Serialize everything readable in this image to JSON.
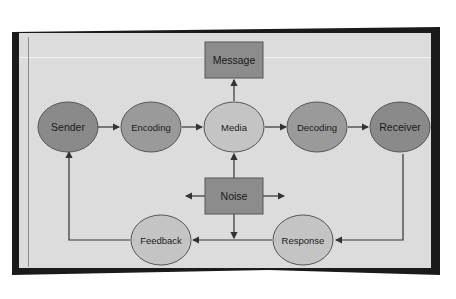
{
  "diagram": {
    "colors": {
      "dark_node": "#8a8a8a",
      "light_node": "#c4c4c4",
      "box": "#8c8c8c",
      "stroke": "#333333",
      "panel": "#dcdcdc",
      "frame": "#1a1a1a"
    },
    "nodes": {
      "sender": "Sender",
      "encoding": "Encoding",
      "media": "Media",
      "decoding": "Decoding",
      "receiver": "Receiver",
      "message": "Message",
      "noise": "Noise",
      "feedback": "Feedback",
      "response": "Response"
    },
    "edges": [
      {
        "from": "Sender",
        "to": "Encoding"
      },
      {
        "from": "Encoding",
        "to": "Media"
      },
      {
        "from": "Media",
        "to": "Decoding"
      },
      {
        "from": "Decoding",
        "to": "Receiver"
      },
      {
        "from": "Media",
        "to": "Message"
      },
      {
        "from": "Noise",
        "to": "Media"
      },
      {
        "from": "Noise",
        "to": "left"
      },
      {
        "from": "Noise",
        "to": "right"
      },
      {
        "from": "Noise",
        "to": "down"
      },
      {
        "from": "Receiver",
        "to": "Response"
      },
      {
        "from": "Response",
        "to": "Feedback"
      },
      {
        "from": "Feedback",
        "to": "Sender"
      }
    ]
  }
}
